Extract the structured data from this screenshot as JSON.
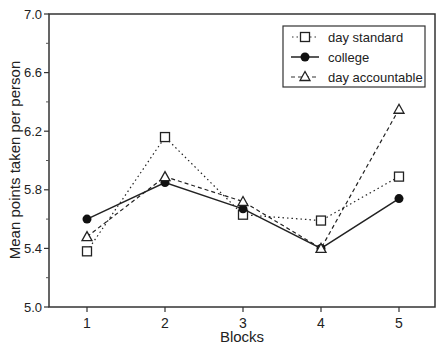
{
  "chart_data": {
    "type": "line",
    "title": "",
    "xlabel": "Blocks",
    "ylabel": "Mean points taken per person",
    "categories": [
      "1",
      "2",
      "3",
      "4",
      "5"
    ],
    "x": [
      1,
      2,
      3,
      4,
      5
    ],
    "ylim": [
      5.0,
      7.0
    ],
    "yticks": [
      "5.0",
      "5.4",
      "5.8",
      "6.2",
      "6.6",
      "7.0"
    ],
    "grid": false,
    "legend_position": "upper right",
    "series": [
      {
        "name": "day standard",
        "marker": "open-square",
        "line": "dotted",
        "values": [
          5.38,
          6.16,
          5.63,
          5.59,
          5.89
        ]
      },
      {
        "name": "college",
        "marker": "filled-circle",
        "line": "solid",
        "values": [
          5.6,
          5.85,
          5.67,
          5.4,
          5.74
        ]
      },
      {
        "name": "day accountable",
        "marker": "open-triangle",
        "line": "dashed",
        "values": [
          5.48,
          5.89,
          5.72,
          5.4,
          6.35
        ]
      }
    ]
  },
  "axes": {
    "x_title": "Blocks",
    "y_title": "Mean points taken per person",
    "x_ticks": [
      "1",
      "2",
      "3",
      "4",
      "5"
    ],
    "y_ticks": [
      "5.0",
      "5.4",
      "5.8",
      "6.2",
      "6.6",
      "7.0"
    ]
  },
  "legend": {
    "items": [
      {
        "label": "day standard"
      },
      {
        "label": "college"
      },
      {
        "label": "day accountable"
      }
    ]
  },
  "colors": {
    "ink": "#222222",
    "background": "#ffffff"
  }
}
